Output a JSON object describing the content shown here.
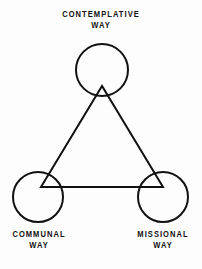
{
  "diagram": {
    "type": "triangle-venn",
    "background_color": "#fdfdfd",
    "stroke_color": "#111111",
    "stroke_width": 2,
    "nodes": [
      {
        "id": "contemplative",
        "label_line_1": "CONTEMPLATIVE",
        "label_line_2": "WAY",
        "circle": {
          "cx": 102,
          "cy": 70,
          "r": 26
        },
        "vertex": {
          "x": 102,
          "y": 86
        },
        "label_position": "above"
      },
      {
        "id": "communal",
        "label_line_1": "COMMUNAL",
        "label_line_2": "WAY",
        "circle": {
          "cx": 38,
          "cy": 197,
          "r": 25
        },
        "vertex": {
          "x": 41,
          "y": 187
        },
        "label_position": "below"
      },
      {
        "id": "missional",
        "label_line_1": "MISSIONAL",
        "label_line_2": "WAY",
        "circle": {
          "cx": 163,
          "cy": 197,
          "r": 25
        },
        "vertex": {
          "x": 163,
          "y": 187
        },
        "label_position": "below"
      }
    ],
    "edges": [
      {
        "id": "contemplative-communal",
        "from": "contemplative",
        "to": "communal"
      },
      {
        "id": "communal-missional",
        "from": "communal",
        "to": "missional"
      },
      {
        "id": "missional-contemplative",
        "from": "missional",
        "to": "contemplative"
      }
    ]
  }
}
